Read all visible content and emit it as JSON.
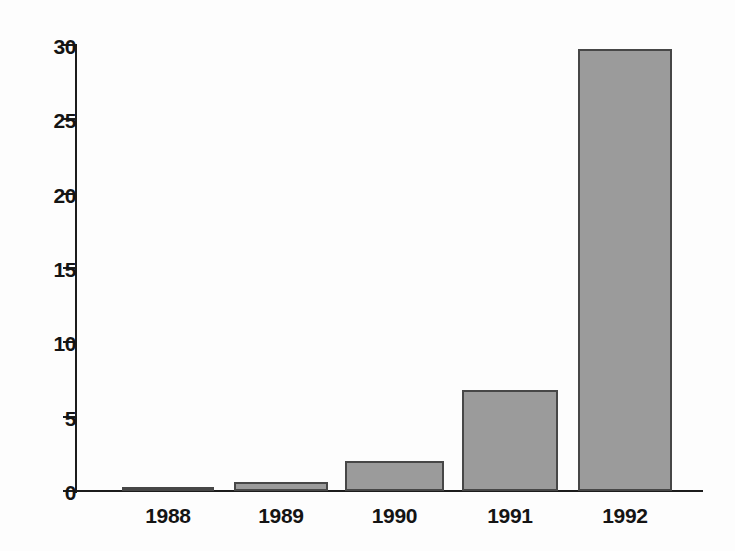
{
  "chart_data": {
    "type": "bar",
    "title": "",
    "subtitle": "",
    "xlabel": "",
    "ylabel": "",
    "categories": [
      "1988",
      "1989",
      "1990",
      "1991",
      "1992"
    ],
    "values": [
      0.25,
      0.6,
      2.0,
      6.8,
      29.7
    ],
    "series": [
      {
        "name": "",
        "values": [
          0.25,
          0.6,
          2.0,
          6.8,
          29.7
        ]
      }
    ],
    "ylim": [
      0,
      30
    ],
    "yticks": [
      0,
      5,
      10,
      15,
      20,
      25,
      30
    ],
    "ytick_labels": [
      "0",
      "5",
      "10",
      "15",
      "20",
      "25",
      "30"
    ],
    "xtick_labels": [
      "1988",
      "1989",
      "1990",
      "1991",
      "1992"
    ],
    "grid": false,
    "legend": false,
    "legend_position": "none",
    "annotations": [],
    "colors": {
      "bar_fill": "#9b9b9b",
      "bar_border": "#474747",
      "axis": "#1c1c1c",
      "text": "#141414",
      "background": "#fdfdfd"
    }
  }
}
